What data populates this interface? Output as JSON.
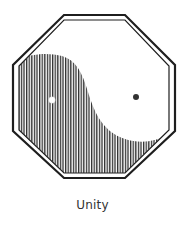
{
  "caption": "Unity",
  "figure": {
    "shape": "octagon",
    "style": "double outline",
    "fill_pattern": "vertical hatching",
    "colors": {
      "outline": "#222222",
      "hatch": "#333333",
      "background": "#ffffff"
    },
    "dots": [
      {
        "name": "light-dot",
        "fill": "#ffffff",
        "cx": 52,
        "cy": 100,
        "r": 3
      },
      {
        "name": "dark-dot",
        "fill": "#333333",
        "cx": 136,
        "cy": 97,
        "r": 3
      }
    ]
  }
}
